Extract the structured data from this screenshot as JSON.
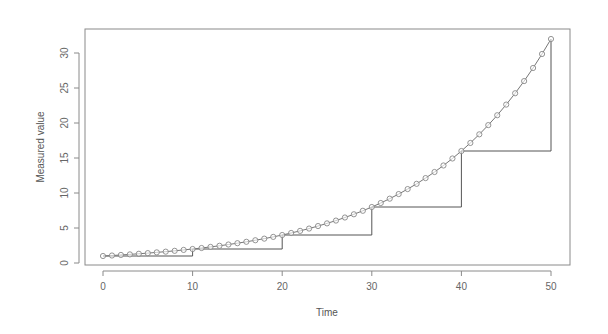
{
  "chart_data": {
    "type": "line",
    "title": "",
    "xlabel": "Time",
    "ylabel": "Measured value",
    "xlim": [
      -2,
      52
    ],
    "ylim": [
      0,
      33
    ],
    "grid": false,
    "legend": null,
    "x_ticks": [
      0,
      10,
      20,
      30,
      40,
      50
    ],
    "y_ticks": [
      0,
      5,
      10,
      15,
      20,
      25,
      30
    ],
    "series": [
      {
        "name": "continuous growth (points)",
        "style": "line with open circle markers",
        "x": [
          0,
          1,
          2,
          3,
          4,
          5,
          6,
          7,
          8,
          9,
          10,
          11,
          12,
          13,
          14,
          15,
          16,
          17,
          18,
          19,
          20,
          21,
          22,
          23,
          24,
          25,
          26,
          27,
          28,
          29,
          30,
          31,
          32,
          33,
          34,
          35,
          36,
          37,
          38,
          39,
          40,
          41,
          42,
          43,
          44,
          45,
          46,
          47,
          48,
          49,
          50
        ],
        "values": [
          1.0,
          1.07,
          1.15,
          1.23,
          1.32,
          1.41,
          1.52,
          1.62,
          1.74,
          1.87,
          2.0,
          2.14,
          2.3,
          2.46,
          2.64,
          2.83,
          3.03,
          3.25,
          3.48,
          3.73,
          4.0,
          4.29,
          4.59,
          4.92,
          5.28,
          5.66,
          6.06,
          6.5,
          6.96,
          7.46,
          8.0,
          8.57,
          9.19,
          9.85,
          10.56,
          11.31,
          12.13,
          13.0,
          13.93,
          14.93,
          16.0,
          17.15,
          18.38,
          19.7,
          21.11,
          22.63,
          24.25,
          25.99,
          27.86,
          29.86,
          32.0
        ]
      },
      {
        "name": "doubling step function",
        "style": "step line",
        "x": [
          0,
          10,
          20,
          30,
          40,
          50
        ],
        "values": [
          1,
          2,
          4,
          8,
          16,
          32
        ]
      }
    ]
  },
  "labels": {
    "x_title": "Time",
    "y_title": "Measured value",
    "x_ticks": [
      "0",
      "10",
      "20",
      "30",
      "40",
      "50"
    ],
    "y_ticks": [
      "0",
      "5",
      "10",
      "15",
      "20",
      "25",
      "30"
    ]
  }
}
